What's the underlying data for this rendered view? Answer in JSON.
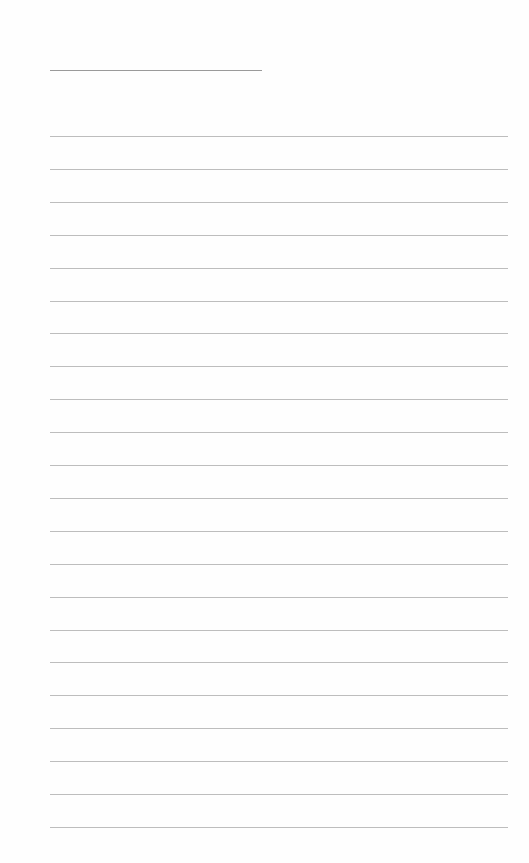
{
  "page": {
    "type": "blank-lined-sheet",
    "title_line": {
      "text": ""
    },
    "ruled_lines": {
      "count": 22,
      "first_y": 136,
      "spacing": 32.9,
      "color": "#bdbdbd"
    },
    "lines": [
      "",
      "",
      "",
      "",
      "",
      "",
      "",
      "",
      "",
      "",
      "",
      "",
      "",
      "",
      "",
      "",
      "",
      "",
      "",
      "",
      "",
      ""
    ]
  }
}
